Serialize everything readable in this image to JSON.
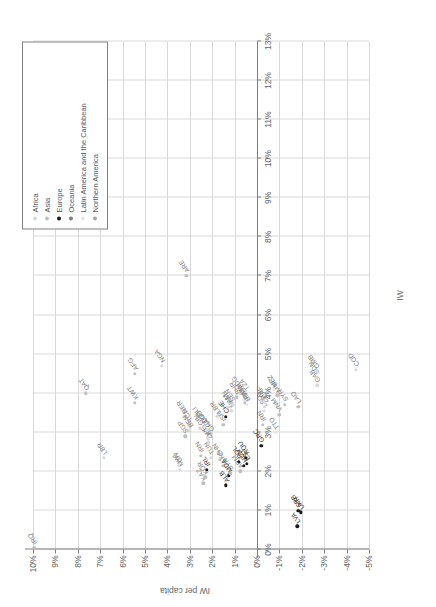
{
  "chart_data": {
    "type": "scatter",
    "title": "",
    "xlabel": "IW",
    "ylabel": "IW per capita",
    "xlim": [
      0,
      0.13
    ],
    "ylim": [
      -0.05,
      0.1
    ],
    "grid": true,
    "xticks": [
      "0%",
      "1%",
      "2%",
      "3%",
      "4%",
      "5%",
      "6%",
      "7%",
      "8%",
      "9%",
      "10%",
      "11%",
      "12%",
      "13%"
    ],
    "yticks": [
      "10%",
      "9%",
      "8%",
      "7%",
      "6%",
      "5%",
      "4%",
      "3%",
      "2%",
      "1%",
      "0%",
      "-1%",
      "-2%",
      "-3%",
      "-4%",
      "-5%"
    ],
    "legend": {
      "position": "top-right",
      "entries": [
        {
          "label": "Africa",
          "color": "#d9d9d9"
        },
        {
          "label": "Asia",
          "color": "#bfbfbf"
        },
        {
          "label": "Europe",
          "color": "#1a1a1a"
        },
        {
          "label": "Oceania",
          "color": "#7f7f7f"
        },
        {
          "label": "Latin America and the Caribbean",
          "color": "#e8e8e8"
        },
        {
          "label": "Northern America",
          "color": "#a6a6a6"
        }
      ]
    },
    "points": [
      {
        "label": "IRQ",
        "x": 0.0005,
        "y": 0.0995,
        "g": 1
      },
      {
        "label": "LBR",
        "x": 0.0235,
        "y": 0.0685,
        "g": 0
      },
      {
        "label": "QAT",
        "x": 0.04,
        "y": 0.0765,
        "g": 1
      },
      {
        "label": "KWT",
        "x": 0.0375,
        "y": 0.0545,
        "g": 1
      },
      {
        "label": "AFG",
        "x": 0.045,
        "y": 0.0545,
        "g": 1
      },
      {
        "label": "NGA",
        "x": 0.047,
        "y": 0.0425,
        "g": 0
      },
      {
        "label": "ARE",
        "x": 0.07,
        "y": 0.0315,
        "g": 1
      },
      {
        "label": "MWI",
        "x": 0.0205,
        "y": 0.0345,
        "g": 0
      },
      {
        "label": "CIV",
        "x": 0.0215,
        "y": 0.035,
        "g": 0
      },
      {
        "label": "SGP",
        "x": 0.029,
        "y": 0.032,
        "g": 1
      },
      {
        "label": "NER",
        "x": 0.034,
        "y": 0.0325,
        "g": 0
      },
      {
        "label": "TCD",
        "x": 0.032,
        "y": 0.0305,
        "g": 0
      },
      {
        "label": "BEN",
        "x": 0.0305,
        "y": 0.03,
        "g": 0
      },
      {
        "label": "MLI",
        "x": 0.033,
        "y": 0.0265,
        "g": 0
      },
      {
        "label": "GIN",
        "x": 0.031,
        "y": 0.0255,
        "g": 0
      },
      {
        "label": "KAZ",
        "x": 0.017,
        "y": 0.024,
        "g": 1
      },
      {
        "label": "IRN",
        "x": 0.024,
        "y": 0.025,
        "g": 1
      },
      {
        "label": "KOR",
        "x": 0.0185,
        "y": 0.023,
        "g": 1
      },
      {
        "label": "IRL",
        "x": 0.0205,
        "y": 0.0225,
        "g": 2
      },
      {
        "label": "TUN",
        "x": 0.0235,
        "y": 0.0205,
        "g": 0
      },
      {
        "label": "GHA",
        "x": 0.0295,
        "y": 0.0205,
        "g": 0
      },
      {
        "label": "ZWE",
        "x": 0.0275,
        "y": 0.0215,
        "g": 0
      },
      {
        "label": "BFA",
        "x": 0.0285,
        "y": 0.022,
        "g": 0
      },
      {
        "label": "COG",
        "x": 0.0305,
        "y": 0.0225,
        "g": 0
      },
      {
        "label": "TGO",
        "x": 0.0315,
        "y": 0.0235,
        "g": 0
      },
      {
        "label": "ALB",
        "x": 0.0165,
        "y": 0.014,
        "g": 2
      },
      {
        "label": "CHN",
        "x": 0.023,
        "y": 0.0165,
        "g": 1
      },
      {
        "label": "LKA",
        "x": 0.0215,
        "y": 0.015,
        "g": 1
      },
      {
        "label": "MDA",
        "x": 0.019,
        "y": 0.0125,
        "g": 2
      },
      {
        "label": "SYR",
        "x": 0.0195,
        "y": 0.012,
        "g": 1
      },
      {
        "label": "LBR2",
        "x": 0.034,
        "y": 0.018,
        "g": 0
      },
      {
        "label": "ISR",
        "x": 0.032,
        "y": 0.015,
        "g": 1
      },
      {
        "label": "CHE",
        "x": 0.034,
        "y": 0.014,
        "g": 2
      },
      {
        "label": "KEN",
        "x": 0.0365,
        "y": 0.0125,
        "g": 0
      },
      {
        "label": "NAM",
        "x": 0.0355,
        "y": 0.0115,
        "g": 0
      },
      {
        "label": "SEN",
        "x": 0.037,
        "y": 0.011,
        "g": 0
      },
      {
        "label": "ARM",
        "x": 0.02,
        "y": 0.0075,
        "g": 1
      },
      {
        "label": "POL",
        "x": 0.0225,
        "y": 0.008,
        "g": 2
      },
      {
        "label": "HUN",
        "x": 0.0215,
        "y": 0.006,
        "g": 2
      },
      {
        "label": "EST",
        "x": 0.022,
        "y": 0.0045,
        "g": 2
      },
      {
        "label": "ROU",
        "x": 0.0235,
        "y": 0.005,
        "g": 2
      },
      {
        "label": "BHR",
        "x": 0.039,
        "y": 0.009,
        "g": 1
      },
      {
        "label": "MDG",
        "x": 0.04,
        "y": 0.0075,
        "g": 0
      },
      {
        "label": "GTM",
        "x": 0.0385,
        "y": 0.006,
        "g": 4
      },
      {
        "label": "TZA",
        "x": 0.04,
        "y": 0.005,
        "g": 0
      },
      {
        "label": "PAK",
        "x": 0.0375,
        "y": 0.0055,
        "g": 1
      },
      {
        "label": "BOL",
        "x": 0.037,
        "y": 0.0045,
        "g": 4
      },
      {
        "label": "GRC",
        "x": 0.0265,
        "y": -0.002,
        "g": 2
      },
      {
        "label": "IRN2",
        "x": 0.032,
        "y": -0.0025,
        "g": 1
      },
      {
        "label": "LSO",
        "x": 0.0355,
        "y": -0.003,
        "g": 0
      },
      {
        "label": "ZMB",
        "x": 0.0365,
        "y": -0.0035,
        "g": 0
      },
      {
        "label": "CAF",
        "x": 0.038,
        "y": -0.003,
        "g": 0
      },
      {
        "label": "TTO",
        "x": 0.03,
        "y": -0.0085,
        "g": 4
      },
      {
        "label": "VNM",
        "x": 0.0345,
        "y": -0.01,
        "g": 1
      },
      {
        "label": "MMR",
        "x": 0.0395,
        "y": -0.009,
        "g": 1
      },
      {
        "label": "BLZ",
        "x": 0.041,
        "y": -0.0075,
        "g": 4
      },
      {
        "label": "SYR2",
        "x": 0.037,
        "y": -0.0125,
        "g": 1
      },
      {
        "label": "LAO",
        "x": 0.0365,
        "y": -0.0185,
        "g": 1
      },
      {
        "label": "GAB",
        "x": 0.042,
        "y": -0.027,
        "g": 0
      },
      {
        "label": "SDN",
        "x": 0.044,
        "y": -0.0265,
        "g": 0
      },
      {
        "label": "GMB",
        "x": 0.0455,
        "y": -0.0265,
        "g": 0
      },
      {
        "label": "COD",
        "x": 0.046,
        "y": -0.044,
        "g": 0
      },
      {
        "label": "LVA",
        "x": 0.006,
        "y": -0.018,
        "g": 2
      },
      {
        "label": "UKR",
        "x": 0.0095,
        "y": -0.0195,
        "g": 2
      },
      {
        "label": "SRB",
        "x": 0.01,
        "y": -0.0185,
        "g": 2
      }
    ]
  }
}
